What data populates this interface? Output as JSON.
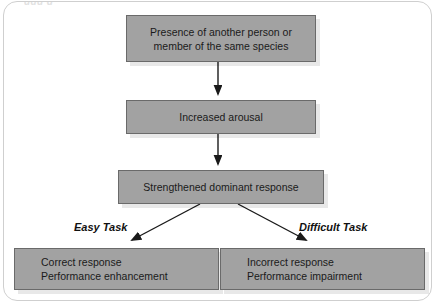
{
  "figure": {
    "clipped_caption": "ggg g",
    "boxes": {
      "presence": {
        "line1": "Presence of another person or",
        "line2": "member of the same species"
      },
      "arousal": {
        "line1": "Increased arousal"
      },
      "dominant": {
        "line1": "Strengthened dominant response"
      },
      "easy_outcome": {
        "line1": "Correct response",
        "line2": "Performance enhancement"
      },
      "difficult_outcome": {
        "line1": "Incorrect response",
        "line2": "Performance impairment"
      }
    },
    "labels": {
      "easy_task": "Easy Task",
      "difficult_task": "Difficult Task"
    },
    "colors": {
      "box_fill": "#a2a2a2",
      "box_border": "#6a6a6a",
      "text": "#1a1a1a",
      "arrow": "#1a1a1a",
      "panel_border": "#cfcfcf",
      "background": "#ffffff"
    }
  }
}
